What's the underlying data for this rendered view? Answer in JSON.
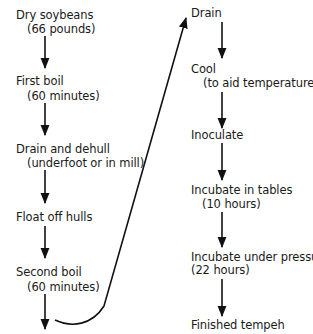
{
  "diagram": {
    "type": "flowchart",
    "left_column": [
      {
        "label": "Dry soybeans",
        "detail": "(66 pounds)"
      },
      {
        "label": "First boil",
        "detail": "(60 minutes)"
      },
      {
        "label": "Drain and dehull",
        "detail": "(underfoot or in mill)"
      },
      {
        "label": "Float off hulls",
        "detail": ""
      },
      {
        "label": "Second boil",
        "detail": "(60 minutes)"
      }
    ],
    "right_column": [
      {
        "label": "Drain",
        "detail": ""
      },
      {
        "label": "Cool",
        "detail": "(to aid temperature)"
      },
      {
        "label": "Inoculate",
        "detail": ""
      },
      {
        "label": "Incubate in tables",
        "detail": "(10 hours)"
      },
      {
        "label": "Incubate under pressure",
        "detail": "(22 hours)"
      },
      {
        "label": "Finished tempeh",
        "detail": ""
      }
    ],
    "connector": "Second boil → Drain"
  }
}
